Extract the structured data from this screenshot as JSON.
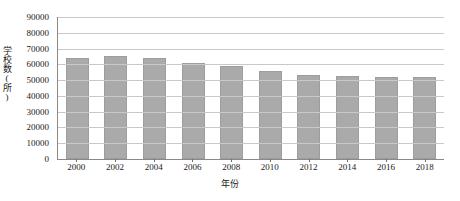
{
  "chart_data": {
    "type": "bar",
    "title": "",
    "xlabel": "年份",
    "ylabel": "学校数(所)",
    "categories": [
      "2000",
      "2002",
      "2004",
      "2006",
      "2008",
      "2010",
      "2012",
      "2014",
      "2016",
      "2018"
    ],
    "values": [
      64000,
      65500,
      63900,
      61000,
      58800,
      56000,
      53400,
      52600,
      52200,
      52000
    ],
    "ylim": [
      0,
      90000
    ],
    "ytick_labels": [
      "90000",
      "80000",
      "70000",
      "60000",
      "50000",
      "40000",
      "30000",
      "20000",
      "10000",
      "0"
    ],
    "ytick_values": [
      90000,
      80000,
      70000,
      60000,
      50000,
      40000,
      30000,
      20000,
      10000,
      0
    ],
    "grid": true,
    "legend": "none",
    "bar_color": "#aaaaaa",
    "grid_color": "#c9c9c9",
    "axis_color": "#8a8a8a"
  }
}
